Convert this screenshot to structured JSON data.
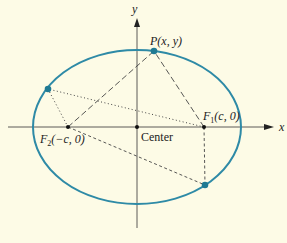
{
  "diagram": {
    "colors": {
      "background": "#fdfbe6",
      "ellipse": "#2e8aa6",
      "point": "#1f7a93",
      "axis": "#333333",
      "line": "#444444"
    },
    "axes": {
      "x_label": "x",
      "y_label": "y"
    },
    "labels": {
      "point_p": "P(x, y)",
      "focus_1_prefix": "F",
      "focus_1_sub": "1",
      "focus_1_coords": "(c, 0)",
      "focus_2_prefix": "F",
      "focus_2_sub": "2",
      "focus_2_coords": "(−c, 0)",
      "center": "Center"
    },
    "relationships": [
      {
        "from": "focus_2",
        "to": "point_p",
        "style": "long-dash"
      },
      {
        "from": "focus_1",
        "to": "point_p",
        "style": "long-dash"
      },
      {
        "from": "focus_2",
        "to": "point_left",
        "style": "dotted"
      },
      {
        "from": "focus_1",
        "to": "point_left",
        "style": "dotted"
      },
      {
        "from": "focus_2",
        "to": "point_lower_right",
        "style": "short-dash"
      },
      {
        "from": "focus_1",
        "to": "point_lower_right",
        "style": "short-dash"
      }
    ]
  }
}
